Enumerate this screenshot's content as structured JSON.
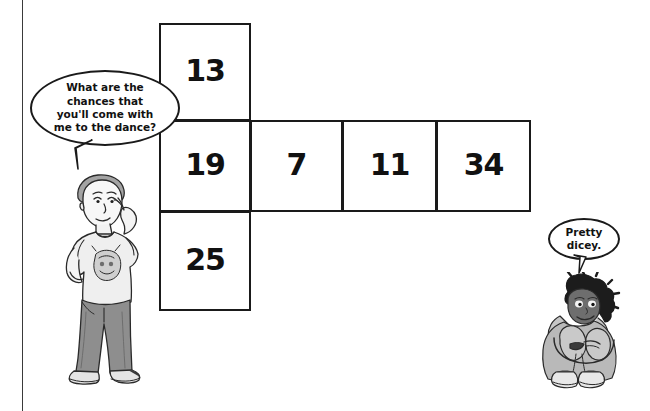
{
  "page": {
    "background_color": "#ffffff",
    "rule_color": "#3a3a3a",
    "ink_color": "#1a1a1a"
  },
  "grid": {
    "name": "die-net-number-grid",
    "shape": "plus/cross net of a cube",
    "column_cells": [
      {
        "id": "cell-13",
        "value": "13",
        "position": "top"
      },
      {
        "id": "cell-19",
        "value": "19",
        "position": "middle"
      },
      {
        "id": "cell-25",
        "value": "25",
        "position": "bottom"
      }
    ],
    "row_cells": [
      {
        "id": "cell-19",
        "value": "19",
        "position": "row-1"
      },
      {
        "id": "cell-7",
        "value": "7",
        "position": "row-2"
      },
      {
        "id": "cell-11",
        "value": "11",
        "position": "row-3"
      },
      {
        "id": "cell-34",
        "value": "34",
        "position": "row-4"
      }
    ],
    "all_values": [
      "13",
      "19",
      "25",
      "7",
      "11",
      "34"
    ]
  },
  "speech": {
    "boy": {
      "lines": [
        "What are the",
        "chances that",
        "you'll come with",
        "me to the dance?"
      ],
      "text": "What are the chances that you'll come with me to the dance?"
    },
    "girl": {
      "lines": [
        "Pretty",
        "dicey."
      ],
      "text": "Pretty dicey."
    }
  },
  "characters": {
    "boy": {
      "name": "standing-boy",
      "pose": "standing, hand on chin, thinking",
      "shirt_color": "#efefef",
      "pants_color": "#8e8e8e",
      "hair_color": "#9a9a9a",
      "shoe_color": "#d8d8d8"
    },
    "girl": {
      "name": "sitting-girl",
      "pose": "sitting with knees drawn up",
      "hoodie_color": "#b9b9b9",
      "hair_color": "#1c1c1c",
      "skin_shade": "#6e6e6e",
      "shoe_color": "#4a4a4a"
    }
  }
}
